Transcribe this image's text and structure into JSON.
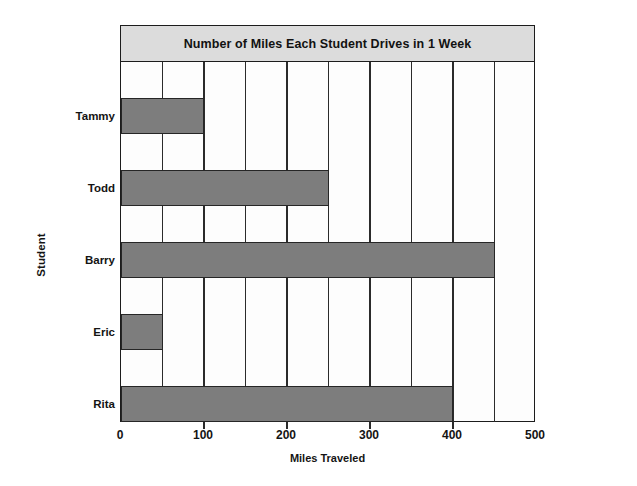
{
  "chart_data": {
    "type": "bar",
    "orientation": "horizontal",
    "title": "Number of Miles Each Student Drives in 1 Week",
    "xlabel": "Miles Traveled",
    "ylabel": "Student",
    "categories": [
      "Tammy",
      "Todd",
      "Barry",
      "Eric",
      "Rita"
    ],
    "values": [
      100,
      250,
      450,
      50,
      400
    ],
    "xlim": [
      0,
      500
    ],
    "xticks": [
      0,
      100,
      200,
      300,
      400,
      500
    ],
    "xtick_labels": [
      "0",
      "100",
      "200",
      "300",
      "400",
      "500"
    ],
    "gridline_interval": 50,
    "grid": true,
    "legend": false,
    "bar_color": "#7d7d7d",
    "bar_edge_color": "#262626",
    "title_band_color": "#dcdcdc",
    "axis_color": "#1c1c1c",
    "plot_background": "#fdfdfd",
    "series": [
      {
        "name": "Miles Traveled",
        "points": [
          {
            "category": "Tammy",
            "value": 100
          },
          {
            "category": "Todd",
            "value": 250
          },
          {
            "category": "Barry",
            "value": 450
          },
          {
            "category": "Eric",
            "value": 50
          },
          {
            "category": "Rita",
            "value": 400
          }
        ]
      }
    ]
  }
}
